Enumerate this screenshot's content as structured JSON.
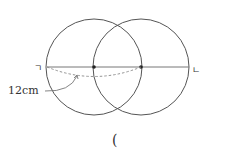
{
  "diagram": {
    "point_left_label": "ㄱ",
    "point_right_label": "ㄴ",
    "measure_label": "12cm",
    "answer_paren": "(",
    "stroke_color": "#555555",
    "dashed_color": "#888888"
  }
}
